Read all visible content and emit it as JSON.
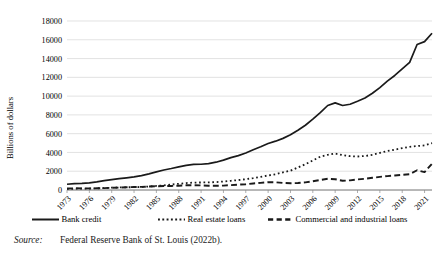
{
  "figure": {
    "source_label": "Source:",
    "source_text": "Federal Reserve Bank of St. Louis (2022b)."
  },
  "chart_data": {
    "type": "line",
    "title": "",
    "subtitle": "",
    "xlabel": "",
    "ylabel": "Billions of dollars",
    "xlim": [
      1973,
      2022
    ],
    "ylim": [
      0,
      18000
    ],
    "grid": true,
    "grid_axis": "y",
    "legend_position": "bottom",
    "ytick_labels": [
      "0",
      "2000",
      "4000",
      "6000",
      "8000",
      "10000",
      "12000",
      "14000",
      "16000",
      "18000"
    ],
    "ytick_values": [
      0,
      2000,
      4000,
      6000,
      8000,
      10000,
      12000,
      14000,
      16000,
      18000
    ],
    "xtick_labels": [
      "1973",
      "1976",
      "1979",
      "1982",
      "1985",
      "1988",
      "1991",
      "1994",
      "1997",
      "2000",
      "2003",
      "2006",
      "2009",
      "2012",
      "2015",
      "2018",
      "2021"
    ],
    "xtick_values": [
      1973,
      1976,
      1979,
      1982,
      1985,
      1988,
      1991,
      1994,
      1997,
      2000,
      2003,
      2006,
      2009,
      2012,
      2015,
      2018,
      2021
    ],
    "x": [
      1973,
      1974,
      1975,
      1976,
      1977,
      1978,
      1979,
      1980,
      1981,
      1982,
      1983,
      1984,
      1985,
      1986,
      1987,
      1988,
      1989,
      1990,
      1991,
      1992,
      1993,
      1994,
      1995,
      1996,
      1997,
      1998,
      1999,
      2000,
      2001,
      2002,
      2003,
      2004,
      2005,
      2006,
      2007,
      2008,
      2009,
      2010,
      2011,
      2012,
      2013,
      2014,
      2015,
      2016,
      2017,
      2018,
      2019,
      2020,
      2021,
      2022
    ],
    "series": [
      {
        "name": "Bank credit",
        "style": "solid",
        "color": "#1a1a1a",
        "values": [
          610,
          680,
          710,
          760,
          860,
          990,
          1110,
          1210,
          1300,
          1390,
          1530,
          1720,
          1930,
          2130,
          2290,
          2470,
          2630,
          2720,
          2740,
          2810,
          2960,
          3180,
          3450,
          3660,
          3940,
          4290,
          4600,
          4950,
          5200,
          5500,
          5880,
          6370,
          6900,
          7540,
          8240,
          9000,
          9280,
          9000,
          9130,
          9450,
          9800,
          10300,
          10900,
          11600,
          12200,
          12900,
          13600,
          15500,
          15800,
          16700
        ]
      },
      {
        "name": "Real estate loans",
        "style": "dotted",
        "color": "#1a1a1a",
        "values": [
          120,
          135,
          140,
          155,
          180,
          215,
          250,
          275,
          290,
          300,
          330,
          375,
          430,
          500,
          580,
          660,
          740,
          790,
          800,
          810,
          840,
          900,
          980,
          1060,
          1150,
          1260,
          1400,
          1550,
          1680,
          1880,
          2060,
          2400,
          2750,
          3150,
          3550,
          3750,
          3880,
          3720,
          3600,
          3570,
          3620,
          3750,
          3950,
          4150,
          4300,
          4450,
          4600,
          4680,
          4750,
          5000
        ]
      },
      {
        "name": "Commercial and industrial loans",
        "style": "dashed",
        "color": "#1a1a1a",
        "values": [
          155,
          180,
          175,
          170,
          180,
          205,
          235,
          260,
          290,
          320,
          330,
          370,
          400,
          420,
          430,
          460,
          500,
          510,
          490,
          460,
          450,
          470,
          520,
          570,
          620,
          700,
          760,
          830,
          820,
          750,
          720,
          740,
          810,
          930,
          1070,
          1200,
          1150,
          980,
          1030,
          1120,
          1200,
          1300,
          1400,
          1480,
          1550,
          1620,
          1680,
          2100,
          1900,
          2800
        ]
      }
    ]
  },
  "legend": {
    "items": [
      {
        "label": "Bank credit",
        "style": "solid"
      },
      {
        "label": "Real estate loans",
        "style": "dotted"
      },
      {
        "label": "Commercial and industrial loans",
        "style": "dashed"
      }
    ]
  }
}
